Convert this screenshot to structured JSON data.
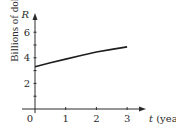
{
  "chart_data": {
    "type": "line",
    "title": "",
    "xlabel": "t (years)",
    "x_var": "t",
    "x_unit": "(years)",
    "ylabel": "Billions of dollars",
    "y_var": "R",
    "x_ticks": [
      0,
      1,
      2,
      3
    ],
    "x_tick_labels": [
      "0",
      "1",
      "2",
      "3"
    ],
    "y_ticks": [
      2,
      4,
      6
    ],
    "y_tick_labels": [
      "2",
      "4",
      "6"
    ],
    "xlim": [
      0,
      3.3
    ],
    "ylim": [
      0,
      6.9
    ],
    "grid": false,
    "legend": null,
    "series": [
      {
        "name": "R(t)",
        "x": [
          0,
          0.5,
          1,
          1.5,
          2,
          2.5,
          3
        ],
        "values": [
          3.3,
          3.62,
          3.9,
          4.18,
          4.45,
          4.66,
          4.85
        ]
      }
    ],
    "colors": {
      "axis": "#2a2a2a",
      "line": "#1e1e1e"
    }
  },
  "axis_labels": {
    "y_var": "R",
    "x_var": "t",
    "x_unit": "(years)",
    "y_title": "Billions of dollars",
    "origin": "0"
  }
}
